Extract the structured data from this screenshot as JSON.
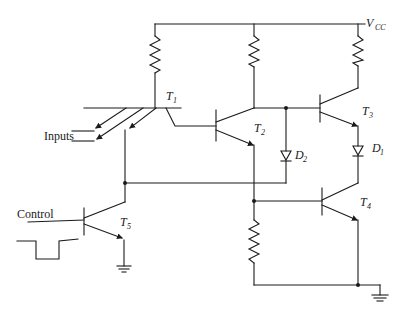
{
  "diagram": {
    "type": "circuit-schematic",
    "supply": {
      "label": "V",
      "subscript": "CC"
    },
    "labels": {
      "inputs": "Inputs",
      "control": "Control"
    },
    "transistors": [
      {
        "id": "T1",
        "name": "T",
        "sub": "1",
        "kind": "multi-emitter NPN"
      },
      {
        "id": "T2",
        "name": "T",
        "sub": "2",
        "kind": "NPN"
      },
      {
        "id": "T3",
        "name": "T",
        "sub": "3",
        "kind": "NPN"
      },
      {
        "id": "T4",
        "name": "T",
        "sub": "4",
        "kind": "NPN"
      },
      {
        "id": "T5",
        "name": "T",
        "sub": "5",
        "kind": "NPN"
      }
    ],
    "diodes": [
      {
        "id": "D1",
        "name": "D",
        "sub": "1"
      },
      {
        "id": "D2",
        "name": "D",
        "sub": "2"
      }
    ],
    "resistors": 4,
    "grounds": 2,
    "control_waveform": "negative pulse"
  }
}
